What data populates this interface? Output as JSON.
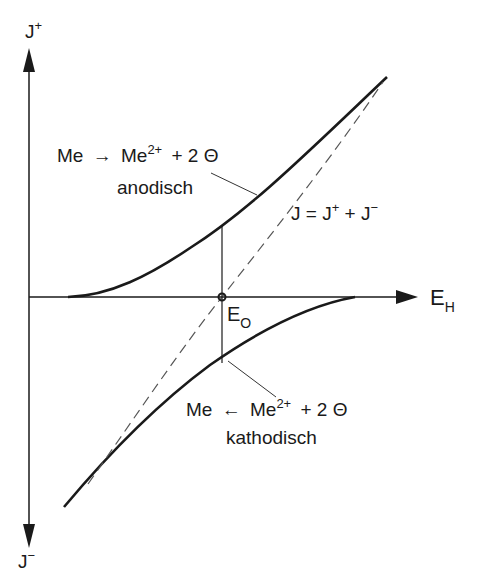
{
  "diagram": {
    "axes": {
      "y_top_label": "J",
      "y_top_sup": "+",
      "y_bottom_label": "J",
      "y_bottom_sup": "−",
      "x_label": "E",
      "x_sub": "H"
    },
    "equilibrium": {
      "label": "E",
      "sub": "O"
    },
    "anodic": {
      "reaction_left": "Me",
      "arrow": "→",
      "reaction_right": "Me",
      "charge": "2+",
      "electrons": "+ 2 Θ",
      "name": "anodisch"
    },
    "cathodic": {
      "reaction_left": "Me",
      "arrow": "←",
      "reaction_right": "Me",
      "charge": "2+",
      "electrons": "+ 2 Θ",
      "name": "kathodisch"
    },
    "sum": {
      "lhs": "J = J",
      "sup1": "+",
      "mid": " + J",
      "sup2": "−"
    },
    "colors": {
      "ink": "#1a1a1a",
      "dashed": "#555555",
      "background": "#ffffff"
    }
  }
}
